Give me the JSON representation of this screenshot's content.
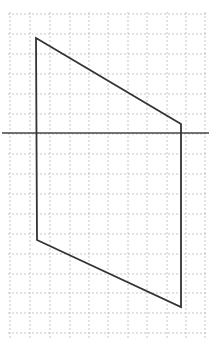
{
  "diagram": {
    "type": "geometry-figure-on-grid",
    "colors": {
      "background": "#ffffff",
      "grid": "#b8b8b8",
      "figure": "#333333",
      "line": "#444444"
    },
    "grid": {
      "x_lines": [
        10,
        30,
        50,
        70,
        89,
        108,
        128,
        147,
        167,
        186,
        205
      ],
      "y_lines": [
        14,
        34,
        54,
        74,
        94,
        114,
        134,
        154,
        174,
        194,
        214,
        234,
        254,
        274,
        293,
        313,
        333
      ],
      "x_start": 8,
      "x_end": 208,
      "y_start": 12,
      "y_end": 340
    },
    "polygon": {
      "name": "quadrilateral",
      "vertices": [
        {
          "x": 36,
          "y": 38
        },
        {
          "x": 181,
          "y": 124
        },
        {
          "x": 181,
          "y": 307
        },
        {
          "x": 37,
          "y": 240
        }
      ]
    },
    "horizontal_line": {
      "x1": 2,
      "y1": 133,
      "x2": 209,
      "y2": 133
    }
  }
}
